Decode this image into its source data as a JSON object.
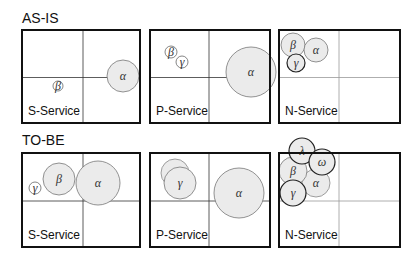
{
  "sections": [
    {
      "label": "AS-IS",
      "panels": [
        {
          "service": "S-Service",
          "bubbles": [
            {
              "symbol": "β",
              "cx": 36,
              "cy": 56,
              "r": 5,
              "fill": "#ffffff",
              "stroke": "#666"
            },
            {
              "symbol": "α",
              "cx": 101,
              "cy": 46,
              "r": 16,
              "fill": "#ebebeb",
              "stroke": "#777"
            }
          ]
        },
        {
          "service": "P-Service",
          "bubbles": [
            {
              "symbol": "β",
              "cx": 21,
              "cy": 22,
              "r": 6,
              "fill": "#ffffff",
              "stroke": "#666"
            },
            {
              "symbol": "γ",
              "cx": 32,
              "cy": 32,
              "r": 6,
              "fill": "#ffffff",
              "stroke": "#666"
            },
            {
              "symbol": "α",
              "cx": 101,
              "cy": 42,
              "r": 25,
              "fill": "#ebebeb",
              "stroke": "#777"
            }
          ]
        },
        {
          "service": "N-Service",
          "bubbles": [
            {
              "symbol": "β",
              "cx": 14,
              "cy": 15,
              "r": 12,
              "fill": "#ebebeb",
              "stroke": "#777"
            },
            {
              "symbol": "α",
              "cx": 37,
              "cy": 20,
              "r": 12,
              "fill": "#ebebeb",
              "stroke": "#777"
            },
            {
              "symbol": "γ",
              "cx": 17,
              "cy": 33,
              "r": 9,
              "fill": "#ebebeb",
              "stroke": "#222"
            }
          ]
        }
      ]
    },
    {
      "label": "TO-BE",
      "panels": [
        {
          "service": "S-Service",
          "bubbles": [
            {
              "symbol": "γ",
              "cx": 13,
              "cy": 35,
              "r": 6,
              "fill": "#ffffff",
              "stroke": "#666"
            },
            {
              "symbol": "β",
              "cx": 37,
              "cy": 26,
              "r": 16,
              "fill": "#ebebeb",
              "stroke": "#777"
            },
            {
              "symbol": "α",
              "cx": 76,
              "cy": 30,
              "r": 22,
              "fill": "#ebebeb",
              "stroke": "#777"
            }
          ]
        },
        {
          "service": "P-Service",
          "bubbles": [
            {
              "symbol": "",
              "cx": 25,
              "cy": 20,
              "r": 14,
              "fill": "#ebebeb",
              "stroke": "#888"
            },
            {
              "symbol": "γ",
              "cx": 30,
              "cy": 30,
              "r": 16,
              "fill": "#ebebeb",
              "stroke": "#777"
            },
            {
              "symbol": "α",
              "cx": 89,
              "cy": 40,
              "r": 25,
              "fill": "#ebebeb",
              "stroke": "#777"
            }
          ]
        },
        {
          "service": "N-Service",
          "bubbles": [
            {
              "symbol": "α",
              "cx": 37,
              "cy": 30,
              "r": 14,
              "fill": "#ebebeb",
              "stroke": "#888"
            },
            {
              "symbol": "β",
              "cx": 14,
              "cy": 18,
              "r": 14,
              "fill": "#ebebeb",
              "stroke": "#777"
            },
            {
              "symbol": "λ",
              "cx": 23,
              "cy": -2,
              "r": 13,
              "fill": "#ebebeb",
              "stroke": "#222"
            },
            {
              "symbol": "ω",
              "cx": 43,
              "cy": 9,
              "r": 13,
              "fill": "#ebebeb",
              "stroke": "#222"
            },
            {
              "symbol": "γ",
              "cx": 14,
              "cy": 40,
              "r": 13,
              "fill": "#ebebeb",
              "stroke": "#222"
            }
          ]
        }
      ]
    }
  ]
}
